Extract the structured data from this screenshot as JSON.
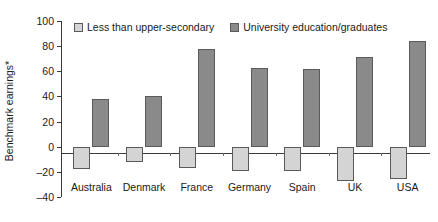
{
  "chart_data": {
    "type": "bar",
    "title": "",
    "xlabel": "",
    "ylabel": "Benchmark earnings*",
    "ylim": [
      -40,
      100
    ],
    "yticks": [
      100,
      80,
      60,
      40,
      20,
      0,
      "-20",
      "-40"
    ],
    "grid": false,
    "legend_position": "top-left",
    "categories": [
      "Australia",
      "Denmark",
      "France",
      "Germany",
      "Spain",
      "UK",
      "USA"
    ],
    "series": [
      {
        "name": "Less than upper-secondary",
        "color": "#d4d4d4",
        "values": [
          -18,
          -12,
          -17,
          -19,
          -19,
          -27,
          -26
        ]
      },
      {
        "name": "University education/graduates",
        "color": "#8a8a8a",
        "values": [
          38,
          40,
          78,
          63,
          62,
          71,
          84
        ]
      }
    ]
  },
  "legend": {
    "items": [
      {
        "label": "Less than upper-secondary"
      },
      {
        "label": "University education/graduates"
      }
    ]
  }
}
